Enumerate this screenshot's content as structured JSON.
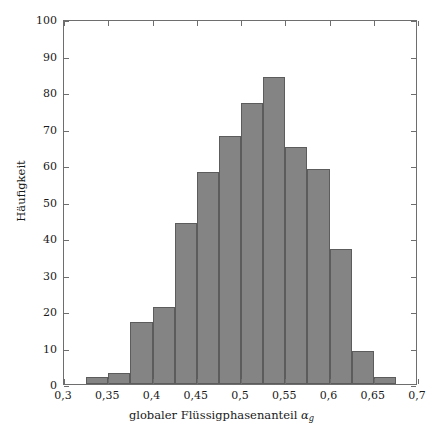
{
  "chart_data": {
    "type": "bar",
    "title": "",
    "subtitle": "",
    "xlabel": "globaler Flüssigphasenanteil αg",
    "xlabel_main": "globaler Flüssigphasenanteil",
    "xlabel_symbol": "α",
    "xlabel_symbol_sub": "g",
    "ylabel": "Häufigkeit",
    "xlim": [
      0.3,
      0.7
    ],
    "ylim": [
      0,
      100
    ],
    "grid": false,
    "legend": null,
    "bin_width": 0.025,
    "bin_edges": [
      0.325,
      0.35,
      0.375,
      0.4,
      0.425,
      0.45,
      0.475,
      0.5,
      0.525,
      0.55,
      0.575,
      0.6,
      0.625,
      0.65,
      0.675
    ],
    "categories": [
      "0,325-0,35",
      "0,35-0,375",
      "0,375-0,4",
      "0,4-0,425",
      "0,425-0,45",
      "0,45-0,475",
      "0,475-0,5",
      "0,5-0,525",
      "0,525-0,55",
      "0,55-0,575",
      "0,575-0,6",
      "0,6-0,625",
      "0,625-0,65",
      "0,65-0,675"
    ],
    "values": [
      2,
      3,
      17,
      21,
      44,
      58,
      68,
      77,
      84,
      65,
      59,
      37,
      9,
      2
    ],
    "bar_color": "#848484",
    "bar_edge_color": "#5c5c5c",
    "axis_color": "#6e6e6e",
    "background_color": "#ffffff",
    "xticks": [
      0.3,
      0.35,
      0.4,
      0.45,
      0.5,
      0.55,
      0.6,
      0.65,
      0.7
    ],
    "xtick_labels": [
      "0,3",
      "0,35",
      "0,4",
      "0,45",
      "0,5",
      "0,55",
      "0,6",
      "0,65",
      "0,7"
    ],
    "yticks": [
      0,
      10,
      20,
      30,
      40,
      50,
      60,
      70,
      80,
      90,
      100
    ],
    "ytick_labels": [
      "0",
      "10",
      "20",
      "30",
      "40",
      "50",
      "60",
      "70",
      "80",
      "90",
      "100"
    ]
  }
}
